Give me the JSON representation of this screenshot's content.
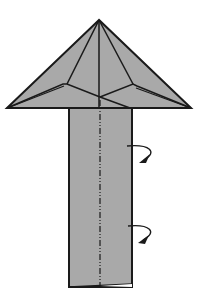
{
  "diagram": {
    "type": "origami-fold-step",
    "paper_color": "#a9a9a9",
    "line_color": "#1a1a1a",
    "background": "#ffffff",
    "shapes": {
      "roof": {
        "apex": [
          99,
          20
        ],
        "left": [
          7,
          108
        ],
        "right": [
          191,
          108
        ]
      },
      "stem": {
        "x": 69,
        "y": 108,
        "width": 63,
        "height": 180
      }
    },
    "annotations": [
      {
        "kind": "mountain-fold-line",
        "orientation": "vertical",
        "x": 100
      },
      {
        "kind": "turn-over-arrow",
        "position": "upper"
      },
      {
        "kind": "turn-over-arrow",
        "position": "lower"
      }
    ]
  }
}
